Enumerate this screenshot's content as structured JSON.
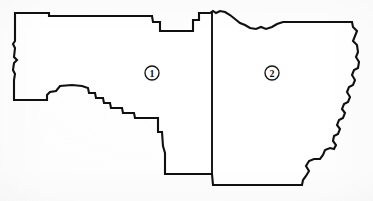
{
  "figure": {
    "type": "district-map",
    "background_color": "#fcfcfc",
    "paper_color": "#ffffff",
    "outline_color": "#101010",
    "outline_width_px": 2.1,
    "width_px": 373,
    "height_px": 201
  },
  "regions": [
    {
      "id": "region-1",
      "label": "1",
      "label_style": "circled-number",
      "label_position": {
        "x": 152,
        "y": 73
      },
      "label_radius_px": 7,
      "position_in_map": "west",
      "boundary_character": "straight northern edge, stepped southwestern staircase, vertical eastern divider"
    },
    {
      "id": "region-2",
      "label": "2",
      "label_style": "circled-number",
      "label_position": {
        "x": 272,
        "y": 73
      },
      "label_radius_px": 7,
      "position_in_map": "east",
      "boundary_character": "irregular northern edge, sinuous river-like eastern edge, straight southern edge"
    }
  ],
  "divider": {
    "name": "interior-district-boundary",
    "orientation": "vertical",
    "x_px": 212,
    "y_start_px": 11,
    "y_end_px": 174
  },
  "geometry": {
    "outline_path": "M 15,18 L 15,41 L 13,44 L 15,48 L 14,57 L 17,60 L 14,63 L 13,70 L 15,74 L 14,80 L 14,100 L 47,100 L 47,95 L 50,92 L 56,91 L 60,86 L 72,85 L 82,86 L 88,88 L 89,93 L 95,93 L 96,98 L 103,98 L 104,103 L 110,103 L 111,108 L 122,108 L 123,113 L 134,113 L 135,118 L 158,118 L 158,132 L 162,132 L 163,146 L 165,153 L 165,174 L 212,174 L 213,185 L 302,185 L 303,180 L 306,176 L 309,171 L 306,166 L 309,161 L 314,159 L 320,159 L 323,155 L 325,150 L 330,148 L 334,149 L 336,145 L 333,141 L 334,136 L 338,134 L 340,129 L 337,125 L 339,120 L 343,118 L 345,113 L 342,109 L 344,104 L 348,102 L 350,97 L 347,92 L 349,87 L 353,85 L 355,80 L 352,75 L 354,70 L 358,68 L 359,62 L 356,57 L 358,52 L 357,45 L 353,41 L 355,36 L 357,31 L 353,27 L 352,22 L 283,22 L 277,24 L 272,27 L 266,29 L 261,27 L 256,29 L 250,28 L 245,25 L 240,23 L 235,19 L 230,15 L 225,12 L 220,11 L 216,13 L 213,11 L 210,13 L 199,13 L 199,20 L 193,20 L 193,31 L 160,31 L 160,22 L 153,22 L 152,16 L 49,16 L 49,13 L 15,13 Z",
    "divider_path": "M 212,12 L 212,174"
  }
}
